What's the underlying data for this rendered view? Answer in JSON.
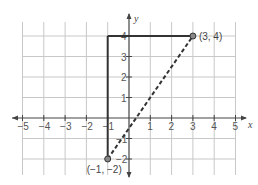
{
  "diagram": {
    "type": "coordinate-plane",
    "axes": {
      "x_label": "x",
      "y_label": "y",
      "x_ticks": [
        "−5",
        "−4",
        "−3",
        "−2",
        "−1",
        "1",
        "2",
        "3",
        "4",
        "5"
      ],
      "x_tick_values": [
        -5,
        -4,
        -3,
        -2,
        -1,
        1,
        2,
        3,
        4,
        5
      ],
      "y_ticks": [
        "4",
        "3",
        "2",
        "1",
        "−1",
        "−2"
      ],
      "y_tick_values": [
        4,
        3,
        2,
        1,
        -1,
        -2
      ],
      "x_range": [
        -5,
        5
      ],
      "y_range": [
        -2,
        4
      ],
      "grid": true
    },
    "points": [
      {
        "label": "(3, 4)",
        "x": 3,
        "y": 4
      },
      {
        "label": "(−1, −2)",
        "x": -1,
        "y": -2
      }
    ],
    "segments": [
      {
        "from": [
          -1,
          -2
        ],
        "to": [
          -1,
          4
        ],
        "style": "solid"
      },
      {
        "from": [
          -1,
          4
        ],
        "to": [
          3,
          4
        ],
        "style": "solid"
      },
      {
        "from": [
          -1,
          -2
        ],
        "to": [
          3,
          4
        ],
        "style": "dashed"
      }
    ],
    "colors": {
      "grid": "#c8c8c8",
      "axis": "#444444",
      "segment": "#333333",
      "point_fill": "#888888"
    }
  }
}
